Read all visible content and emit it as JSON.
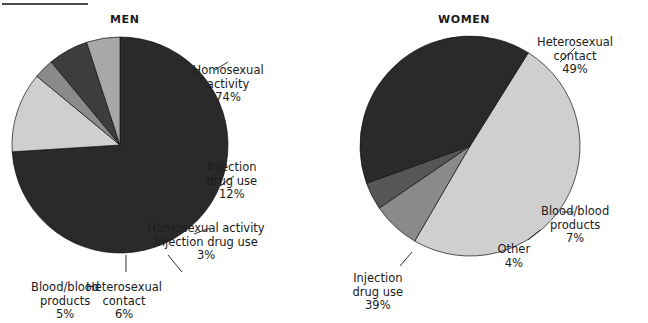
{
  "figure": {
    "rule_label": "top-rule",
    "background": "#ffffff",
    "text_color": "#1b1b1b"
  },
  "charts": [
    {
      "id": "men",
      "title": "MEN",
      "center": [
        120,
        145
      ],
      "radius": 108,
      "start_angle": -90,
      "slices": [
        {
          "label": "Homosexual activity",
          "value": 74,
          "pct_text": "74%",
          "color": "#2a2a2a"
        },
        {
          "label": "Injection drug use",
          "value": 12,
          "pct_text": "12%",
          "color": "#cfcfcf"
        },
        {
          "label": "Homosexual activity Injection drug use",
          "value": 3,
          "pct_text": "3%",
          "color": "#8a8a8a"
        },
        {
          "label": "Heterosexual contact",
          "value": 6,
          "pct_text": "6%",
          "color": "#3d3d3d"
        },
        {
          "label": "Blood/blood products",
          "value": 5,
          "pct_text": "5%",
          "color": "#a8a8a8"
        }
      ],
      "callouts": [
        {
          "name": "men-homosexual-activity",
          "lines": [
            "Homosexual",
            "activity"
          ],
          "pct": "74%",
          "align": "center",
          "pos": [
            228,
            64
          ],
          "leader": [
            [
              215,
              70
            ],
            [
              228,
              62
            ]
          ]
        },
        {
          "name": "men-injection-drug-use",
          "lines": [
            "Injection",
            "drug use"
          ],
          "pct": "12%",
          "align": "center",
          "pos": [
            232,
            161
          ],
          "leader": [
            [
              220,
              186
            ],
            [
              234,
              176
            ]
          ]
        },
        {
          "name": "men-homosexual-and-injection",
          "lines": [
            "Homosexual activity",
            "Injection drug use"
          ],
          "pct": "3%",
          "align": "center",
          "pos": [
            206,
            222
          ],
          "leader": [
            [
              194,
              234
            ],
            [
              210,
              228
            ]
          ]
        },
        {
          "name": "men-heterosexual-contact",
          "lines": [
            "Heterosexual",
            "contact"
          ],
          "pct": "6%",
          "align": "center",
          "pos": [
            124,
            281
          ],
          "leader": [
            [
              168,
              255
            ],
            [
              182,
              272
            ]
          ]
        },
        {
          "name": "men-blood-products",
          "lines": [
            "Blood/blood",
            "products"
          ],
          "pct": "5%",
          "align": "center",
          "pos": [
            65,
            281
          ],
          "leader": [
            [
              126,
              255
            ],
            [
              126,
              272
            ]
          ]
        }
      ]
    },
    {
      "id": "women",
      "title": "WOMEN",
      "center": [
        470,
        146
      ],
      "radius": 110,
      "start_angle": -58,
      "slices": [
        {
          "label": "Heterosexual contact",
          "value": 49,
          "pct_text": "49%",
          "color": "#cfcfcf"
        },
        {
          "label": "Blood/blood products",
          "value": 7,
          "pct_text": "7%",
          "color": "#8a8a8a"
        },
        {
          "label": "Other",
          "value": 4,
          "pct_text": "4%",
          "color": "#565656"
        },
        {
          "label": "Injection drug use",
          "value": 39,
          "pct_text": "39%",
          "color": "#2a2a2a"
        }
      ],
      "callouts": [
        {
          "name": "women-heterosexual-contact",
          "lines": [
            "Heterosexual",
            "contact"
          ],
          "pct": "49%",
          "align": "center",
          "pos": [
            575,
            36
          ],
          "leader": [
            [
              560,
              62
            ],
            [
              575,
              48
            ]
          ]
        },
        {
          "name": "women-blood-products",
          "lines": [
            "Blood/blood",
            "products"
          ],
          "pct": "7%",
          "align": "center",
          "pos": [
            575,
            205
          ],
          "leader": [
            [
              562,
              212
            ],
            [
              574,
              212
            ]
          ]
        },
        {
          "name": "women-other",
          "lines": [
            "Other"
          ],
          "pct": "4%",
          "align": "center",
          "pos": [
            514,
            243
          ],
          "leader": [
            [
              540,
              230
            ],
            [
              528,
              240
            ]
          ]
        },
        {
          "name": "women-injection-drug-use",
          "lines": [
            "Injection",
            "drug use"
          ],
          "pct": "39%",
          "align": "center",
          "pos": [
            378,
            272
          ],
          "leader": [
            [
              412,
              252
            ],
            [
              400,
              266
            ]
          ]
        }
      ]
    }
  ],
  "chart_data": [
    {
      "type": "pie",
      "title": "MEN",
      "categories": [
        "Homosexual activity",
        "Injection drug use",
        "Homosexual activity Injection drug use",
        "Heterosexual contact",
        "Blood/blood products"
      ],
      "values": [
        74,
        12,
        3,
        6,
        5
      ],
      "value_labels": [
        "74%",
        "12%",
        "3%",
        "6%",
        "5%"
      ],
      "colors": [
        "#2a2a2a",
        "#cfcfcf",
        "#8a8a8a",
        "#3d3d3d",
        "#a8a8a8"
      ],
      "units": "percent",
      "legend": "callout labels with leader lines",
      "xlabel": "",
      "ylabel": ""
    },
    {
      "type": "pie",
      "title": "WOMEN",
      "categories": [
        "Heterosexual contact",
        "Injection drug use",
        "Blood/blood products",
        "Other"
      ],
      "values": [
        49,
        39,
        7,
        4
      ],
      "value_labels": [
        "49%",
        "39%",
        "7%",
        "4%"
      ],
      "colors": [
        "#cfcfcf",
        "#2a2a2a",
        "#8a8a8a",
        "#565656"
      ],
      "units": "percent",
      "legend": "callout labels with leader lines",
      "xlabel": "",
      "ylabel": ""
    }
  ]
}
